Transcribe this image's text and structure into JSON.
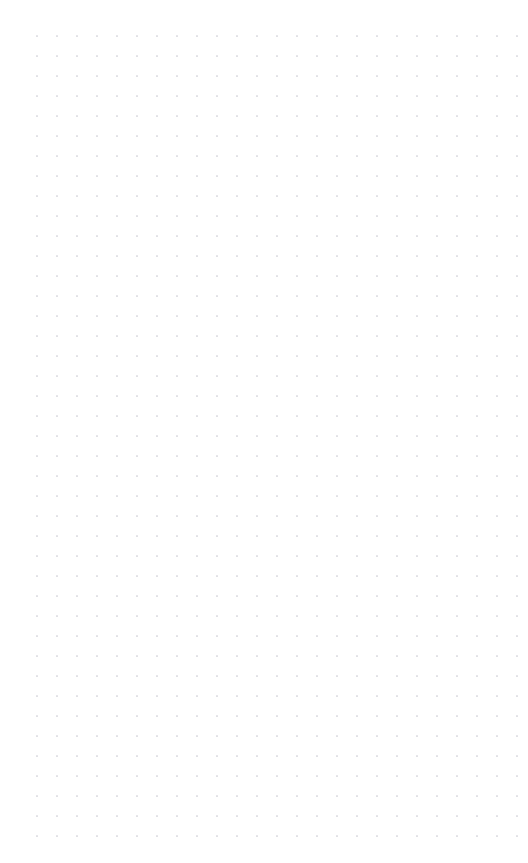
{
  "canvas": {
    "name": "dot-grid-canvas",
    "background_color": "#ffffff",
    "width": 528,
    "height": 863,
    "content_text": "",
    "grid": {
      "pattern": "dot-grid",
      "dot_color": "#c9c9d1",
      "dot_radius": 0.85,
      "spacing_x": 20,
      "spacing_y": 20,
      "origin_x": 37,
      "origin_y": 36,
      "columns": 25,
      "rows": 41,
      "visible": true
    }
  }
}
